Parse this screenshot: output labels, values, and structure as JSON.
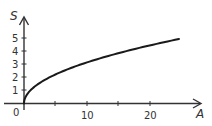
{
  "chart_data": {
    "type": "line",
    "title": "",
    "xlabel": "A",
    "ylabel": "S",
    "xlim": [
      0,
      28
    ],
    "ylim": [
      0,
      6
    ],
    "x_ticks": [
      5,
      10,
      15,
      20
    ],
    "x_tick_labels": [
      "0",
      "10",
      "20"
    ],
    "y_ticks": [
      1,
      2,
      3,
      4,
      5
    ],
    "y_tick_labels": [
      "1",
      "2",
      "3",
      "4",
      "5"
    ],
    "grid": false,
    "legend": null,
    "series": [
      {
        "name": "S = sqrt(A)",
        "x": [
          0,
          0.25,
          1,
          2,
          4,
          6,
          9,
          12,
          16,
          20,
          24.6
        ],
        "y": [
          0,
          0.5,
          1,
          1.41,
          2,
          2.45,
          3,
          3.46,
          4,
          4.47,
          4.96
        ]
      }
    ],
    "colors": {
      "curve": "#1a1a1a",
      "axis": "#333333"
    }
  },
  "labels": {
    "x_axis": "A",
    "y_axis": "S",
    "origin": "0",
    "x10": "10",
    "x20": "20",
    "y1": "1",
    "y2": "2",
    "y3": "3",
    "y4": "4",
    "y5": "5"
  }
}
